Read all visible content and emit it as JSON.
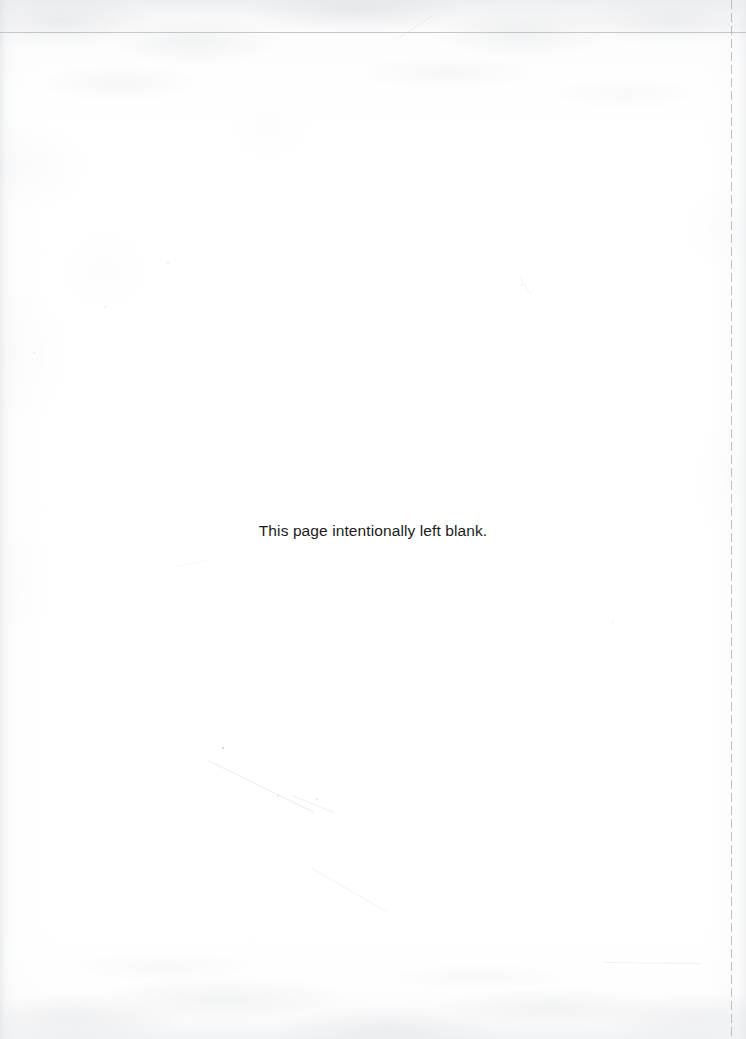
{
  "page": {
    "kind": "scanned-document-page",
    "width": 746,
    "height": 1039,
    "background_color": "#ffffff",
    "notice_text": "This page intentionally left blank.",
    "notice_color": "#1b1b1d"
  },
  "artifacts": {
    "crop_line_horizontal_color": "#b0b4ba",
    "crop_line_vertical_color": "#acb0b7",
    "paper_texture_color": "#cdd0d3",
    "scratch_color": "#c6c9ce"
  }
}
